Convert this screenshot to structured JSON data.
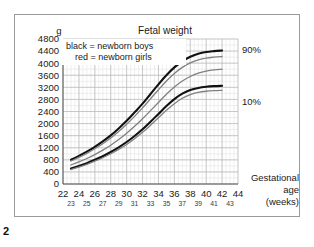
{
  "figure": {
    "number": "2",
    "unit_label": "g",
    "title": "Fetal weight",
    "x_axis_name_lines": [
      "Gestational",
      "age",
      "(weeks)"
    ]
  },
  "legend": {
    "entries": [
      {
        "key": "black",
        "text": "black = newborn boys",
        "color": "#111111"
      },
      {
        "key": "red",
        "text": "red = newborn girls",
        "color": "#808080"
      }
    ]
  },
  "annotations": [
    {
      "name": "percentile-90-label",
      "text": "90%"
    },
    {
      "name": "percentile-10-label",
      "text": "10%"
    }
  ],
  "colors": {
    "boys": "#111111",
    "girls": "#808080",
    "grid_major": "#b9b9b9",
    "grid_minor": "#dedede",
    "axis": "#555555",
    "frame": "#9a9a9a"
  },
  "chart_data": {
    "type": "line",
    "title": "Fetal weight",
    "xlabel": "Gestational age (weeks)",
    "ylabel": "g",
    "xlim": [
      22,
      44
    ],
    "ylim": [
      0,
      4800
    ],
    "ytick_step": 400,
    "yticks": [
      0,
      400,
      800,
      1200,
      1600,
      2000,
      2400,
      2800,
      3200,
      3600,
      4000,
      4400,
      4800
    ],
    "xticks_major": [
      22,
      24,
      26,
      28,
      30,
      32,
      34,
      36,
      38,
      40,
      42,
      44
    ],
    "xticks_minor": [
      23,
      25,
      27,
      29,
      31,
      33,
      35,
      37,
      39,
      41,
      43
    ],
    "grid": true,
    "legend_position": "inside-top-left",
    "x": [
      23,
      24,
      25,
      26,
      27,
      28,
      29,
      30,
      31,
      32,
      33,
      34,
      35,
      36,
      37,
      38,
      39,
      40,
      41,
      42
    ],
    "series": [
      {
        "name": "90th percentile, newborn boys",
        "percentile": "90%",
        "sex": "boys",
        "color": "#111111",
        "values": [
          800,
          930,
          1070,
          1230,
          1410,
          1610,
          1840,
          2090,
          2370,
          2660,
          2980,
          3300,
          3600,
          3860,
          4060,
          4210,
          4310,
          4370,
          4400,
          4420
        ]
      },
      {
        "name": "90th percentile, newborn girls",
        "percentile": "90%",
        "sex": "girls",
        "color": "#808080",
        "values": [
          760,
          880,
          1015,
          1165,
          1335,
          1525,
          1740,
          1980,
          2240,
          2520,
          2820,
          3120,
          3410,
          3660,
          3860,
          4010,
          4110,
          4170,
          4200,
          4220
        ]
      },
      {
        "name": "50th percentile",
        "percentile": "50%",
        "sex": "girls",
        "color": "#808080",
        "values": [
          630,
          730,
          845,
          975,
          1120,
          1285,
          1470,
          1680,
          1910,
          2160,
          2430,
          2700,
          2970,
          3210,
          3410,
          3560,
          3670,
          3740,
          3780,
          3800
        ]
      },
      {
        "name": "10th percentile, newborn boys",
        "percentile": "10%",
        "sex": "boys",
        "color": "#111111",
        "values": [
          510,
          595,
          690,
          800,
          920,
          1060,
          1215,
          1390,
          1590,
          1810,
          2060,
          2320,
          2580,
          2810,
          2990,
          3110,
          3180,
          3220,
          3240,
          3250
        ]
      },
      {
        "name": "10th percentile, newborn girls",
        "percentile": "10%",
        "sex": "girls",
        "color": "#808080",
        "values": [
          480,
          560,
          650,
          755,
          870,
          1000,
          1145,
          1310,
          1500,
          1710,
          1945,
          2190,
          2440,
          2660,
          2840,
          2960,
          3030,
          3070,
          3090,
          3100
        ]
      }
    ]
  }
}
